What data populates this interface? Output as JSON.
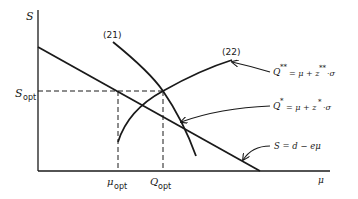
{
  "diagram": {
    "axes": {
      "y_label": "S",
      "x_label": "μ"
    },
    "ticks": {
      "y_opt_main": "S",
      "y_opt_sub": "opt",
      "x_mu_main": "μ",
      "x_mu_sub": "opt",
      "x_q_main": "Q",
      "x_q_sub": "opt"
    },
    "curves": {
      "curve21_label": "(21)",
      "curve22_label": "(22)"
    },
    "annotations": {
      "q_double_star": "Q** = μ + z**·σ",
      "q_star": "Q* = μ + z*·σ",
      "s_line": "S = d − eμ"
    },
    "colors": {
      "ink": "#1a1a1a",
      "background": "#ffffff"
    }
  }
}
